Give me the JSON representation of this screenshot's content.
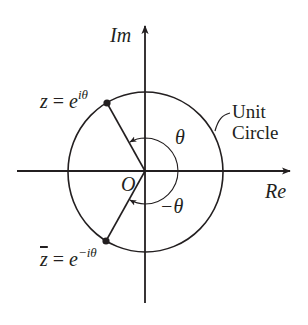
{
  "diagram": {
    "colors": {
      "ink": "#231f20",
      "background": "#ffffff"
    },
    "axes": {
      "imaginary_label": "Im",
      "real_label": "Re",
      "origin_label": "O"
    },
    "circle_label": {
      "line1": "Unit",
      "line2": "Circle"
    },
    "points": [
      {
        "id": "z",
        "lhs": "z",
        "equals": "=",
        "base": "e",
        "exponent": "iθ"
      },
      {
        "id": "zbar",
        "lhs": "z",
        "equals": "=",
        "base": "e",
        "exponent": "−iθ"
      }
    ],
    "angles": [
      {
        "id": "theta",
        "label": "θ"
      },
      {
        "id": "neg-theta",
        "label": "−θ"
      }
    ]
  }
}
